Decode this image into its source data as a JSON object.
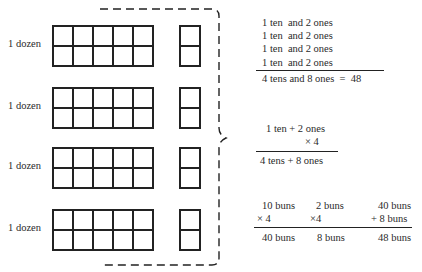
{
  "diagram": {
    "rows": [
      {
        "label": "1 dozen",
        "tens_block": {
          "columns": 5,
          "rows": 2
        },
        "ones_block": {
          "columns": 1,
          "rows": 2
        }
      },
      {
        "label": "1 dozen",
        "tens_block": {
          "columns": 5,
          "rows": 2
        },
        "ones_block": {
          "columns": 1,
          "rows": 2
        }
      },
      {
        "label": "1 dozen",
        "tens_block": {
          "columns": 5,
          "rows": 2
        },
        "ones_block": {
          "columns": 1,
          "rows": 2
        }
      },
      {
        "label": "1 dozen",
        "tens_block": {
          "columns": 5,
          "rows": 2
        },
        "ones_block": {
          "columns": 1,
          "rows": 2
        }
      }
    ],
    "bracket": {
      "style": "dashed",
      "icon": "right-curly-brace-icon"
    }
  },
  "addition": {
    "lines": [
      "1 ten  and 2 ones",
      "1 ten  and 2 ones",
      "1 ten  and 2 ones",
      "1 ten  and 2 ones"
    ],
    "result": "4 tens and 8 ones  =  48"
  },
  "multiplication": {
    "top": "1 ten + 2 ones",
    "multiplier": "× 4",
    "result": "4 tens + 8 ones"
  },
  "buns": {
    "col1": {
      "top": "10 buns",
      "op": "× 4",
      "result": "40 buns"
    },
    "col2": {
      "top": "2 buns",
      "op": "×4",
      "result": "8 buns"
    },
    "col3": {
      "top": "40 buns",
      "op": "+ 8 buns",
      "result": "48 buns"
    }
  }
}
